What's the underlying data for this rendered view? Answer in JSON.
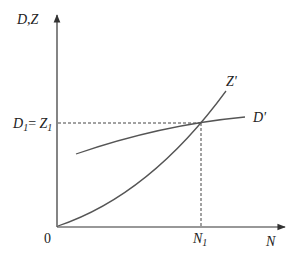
{
  "diagram": {
    "type": "economics-supply-demand",
    "y_axis_label": "D,Z",
    "x_axis_label": "N",
    "origin_label": "0",
    "equilibrium_y_label": {
      "main_left": "D",
      "sub_left": "1",
      "eq": "= ",
      "main_right": "Z",
      "sub_right": "1"
    },
    "equilibrium_x_label": {
      "main": "N",
      "sub": "1"
    },
    "curves": [
      {
        "name": "Z'",
        "label": "Z'",
        "description": "aggregate supply curve, convex increasing from origin"
      },
      {
        "name": "D'",
        "label": "D'",
        "description": "aggregate demand curve, concave increasing"
      }
    ],
    "colors": {
      "axis": "#333333",
      "curve": "#555555",
      "dashed": "#444444"
    }
  }
}
